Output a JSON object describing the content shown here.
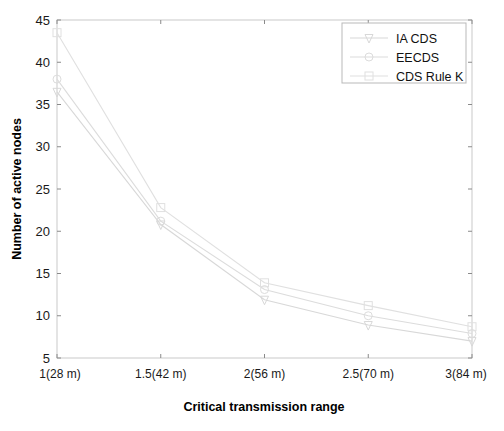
{
  "chart_data": {
    "type": "line",
    "title": "",
    "xlabel": "Critical transmission range",
    "ylabel": "Number of active nodes",
    "categories": [
      "1(28 m)",
      "1.5(42 m)",
      "2(56 m)",
      "2.5(70 m)",
      "3(84 m)"
    ],
    "x": [
      1,
      1.5,
      2,
      2.5,
      3
    ],
    "ylim": [
      5,
      45
    ],
    "yticks": [
      5,
      10,
      15,
      20,
      25,
      30,
      35,
      40,
      45
    ],
    "ytick_labels": [
      "5",
      "10",
      "15",
      "20",
      "25",
      "30",
      "35",
      "40",
      "45"
    ],
    "grid": false,
    "legend_position": "top-right",
    "series": [
      {
        "name": "IA CDS",
        "marker": "triangle-down",
        "color": "#d8d8d8",
        "values": [
          36.5,
          20.8,
          11.9,
          8.9,
          7.0
        ]
      },
      {
        "name": "EECDS",
        "marker": "circle",
        "color": "#dcdcdc",
        "values": [
          38.0,
          21.2,
          13.1,
          10.0,
          7.9
        ]
      },
      {
        "name": "CDS Rule K",
        "marker": "square",
        "color": "#e0e0e0",
        "values": [
          43.5,
          22.8,
          13.9,
          11.2,
          8.7
        ]
      }
    ]
  },
  "legend": {
    "entries": [
      "IA CDS",
      "EECDS",
      "CDS Rule K"
    ]
  },
  "axes": {
    "x_title": "Critical transmission range",
    "y_title": "Number of active nodes"
  },
  "colors": {
    "frame": "#c9c9c9",
    "tick": "#8a8a8a",
    "text": "#111111",
    "background": "#ffffff"
  }
}
